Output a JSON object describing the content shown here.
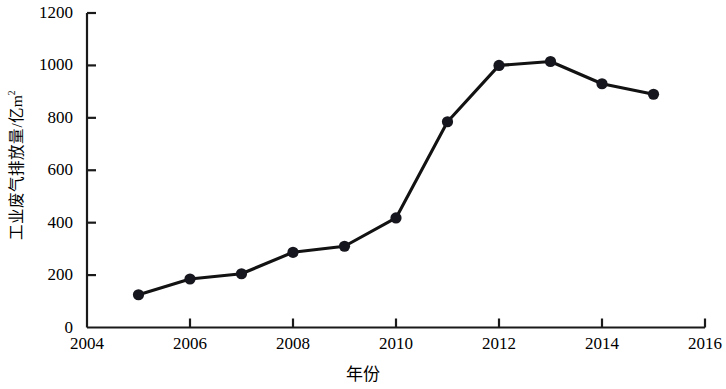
{
  "chart_data": {
    "type": "line",
    "title": "",
    "subtitle": "",
    "xlabel": "年份",
    "ylabel": "工业废气排放量/亿m",
    "ylabel_sup": "2",
    "x": [
      2005,
      2006,
      2007,
      2008,
      2009,
      2010,
      2011,
      2012,
      2013,
      2014,
      2015
    ],
    "values": [
      125,
      185,
      205,
      287,
      310,
      418,
      785,
      1000,
      1015,
      930,
      890
    ],
    "series": [
      {
        "name": "工业废气排放量",
        "values": [
          125,
          185,
          205,
          287,
          310,
          418,
          785,
          1000,
          1015,
          930,
          890
        ]
      }
    ],
    "xlim": [
      2004,
      2016
    ],
    "ylim": [
      0,
      1200
    ],
    "xticks": [
      2004,
      2006,
      2008,
      2010,
      2012,
      2014,
      2016
    ],
    "xtick_labels": [
      "2004",
      "2006",
      "2008",
      "2010",
      "2012",
      "2014",
      "2016"
    ],
    "yticks": [
      0,
      200,
      400,
      600,
      800,
      1000,
      1200
    ],
    "ytick_labels": [
      "0",
      "200",
      "400",
      "600",
      "800",
      "1000",
      "1200"
    ],
    "grid": false,
    "legend": "none",
    "line_color": "#121212",
    "marker_color": "#16161e",
    "marker_shape": "circle",
    "axis_color": "#1a1a1a",
    "background_color": "#ffffff"
  }
}
